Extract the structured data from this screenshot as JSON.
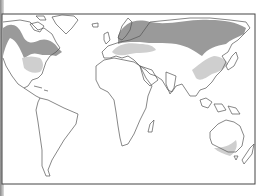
{
  "map": {
    "type": "world-map",
    "projection": "equirectangular-like",
    "frame": {
      "x": 2,
      "y": 14,
      "width": 253,
      "height": 170
    },
    "colors": {
      "background": "#ffffff",
      "outline": "#555555",
      "frame": "#444444",
      "dark_shade": "#9a9a9a",
      "light_shade": "#cfcfcf"
    },
    "regions": [
      {
        "name": "north-america-boreal-band",
        "shade": "dark"
      },
      {
        "name": "eastern-north-america",
        "shade": "light"
      },
      {
        "name": "northern-eurasia-band",
        "shade": "dark"
      },
      {
        "name": "europe-temperate",
        "shade": "light"
      },
      {
        "name": "east-china",
        "shade": "light"
      },
      {
        "name": "southeast-australia",
        "shade": "light"
      }
    ]
  }
}
